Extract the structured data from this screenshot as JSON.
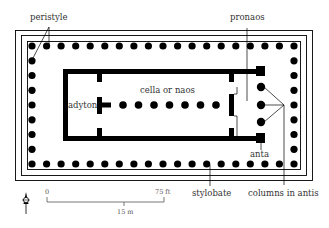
{
  "diagram": {
    "colors": {
      "ink": "#000000",
      "label": "#333333",
      "background": "#ffffff",
      "scale": "#555555"
    },
    "labels": {
      "peristyle": "peristyle",
      "pronaos": "pronaos",
      "cella": "cella or naos",
      "adyton": "adyton",
      "anta": "anta",
      "stylobate": "stylobate",
      "columns_in_antis": "columns in antis"
    },
    "scale_bar": {
      "start_label": "0",
      "end_label": "75 ft",
      "metric_label": "15 m"
    },
    "north_arrow": {
      "icon": "north-arrow-icon"
    },
    "peristyle_columns": {
      "long_side": 19,
      "short_side": 9
    },
    "cella_columns": 7,
    "columns_in_antis_count": 3
  }
}
